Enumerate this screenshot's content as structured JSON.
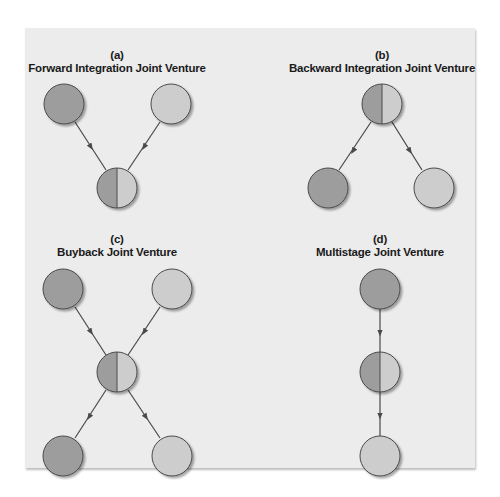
{
  "panels": [
    {
      "letter": "(a)",
      "title": "Forward Integration Joint Venture"
    },
    {
      "letter": "(b)",
      "title": "Backward Integration Joint Venture"
    },
    {
      "letter": "(c)",
      "title": "Buyback Joint Venture"
    },
    {
      "letter": "(d)",
      "title": "Multistage Joint Venture"
    }
  ],
  "colors": {
    "background": "#ececec",
    "dark_partner": "#9d9d9d",
    "light_partner": "#cdcdcd",
    "outline": "#4a4a4a",
    "arrow": "#4a4a4a"
  }
}
